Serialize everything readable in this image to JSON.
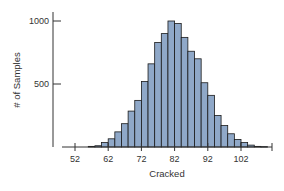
{
  "chart_data": {
    "type": "bar",
    "title": "",
    "xlabel": "Cracked",
    "ylabel": "# of Samples",
    "bin_width": 2,
    "bin_starts": [
      56,
      58,
      60,
      62,
      64,
      66,
      68,
      70,
      72,
      74,
      76,
      78,
      80,
      82,
      84,
      86,
      88,
      90,
      92,
      94,
      96,
      98,
      100,
      102,
      104,
      106,
      108
    ],
    "values": [
      5,
      10,
      35,
      65,
      120,
      185,
      285,
      370,
      520,
      660,
      830,
      900,
      1000,
      980,
      870,
      760,
      700,
      510,
      410,
      250,
      170,
      105,
      60,
      35,
      15,
      5,
      3
    ],
    "x_ticks": [
      52,
      62,
      72,
      82,
      92,
      102
    ],
    "y_ticks": [
      500,
      1000
    ],
    "xlim": [
      48,
      114
    ],
    "ylim": [
      0,
      1050
    ],
    "grid": false,
    "legend": null,
    "bar_color": "#8fa8c8",
    "edge_color": "#1a1a1a"
  },
  "axes": {
    "x_label": "Cracked",
    "y_label": "# of Samples",
    "x_tick_labels": [
      "52",
      "62",
      "72",
      "82",
      "92",
      "102"
    ],
    "y_tick_labels": [
      "500",
      "1000"
    ]
  }
}
